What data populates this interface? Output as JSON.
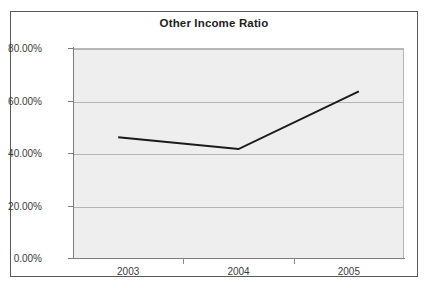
{
  "chart": {
    "title": "Other Income Ratio"
  },
  "chart_data": {
    "type": "line",
    "title": "Other Income Ratio",
    "xlabel": "",
    "ylabel": "",
    "categories": [
      "2003",
      "2004",
      "2005"
    ],
    "series": [
      {
        "name": "Other Income Ratio",
        "values": [
          0.46,
          0.415,
          0.635
        ],
        "color": "#1a1a1a"
      }
    ],
    "y_ticks": [
      0,
      0.2,
      0.4,
      0.6,
      0.8
    ],
    "y_tick_labels": [
      "0.00%",
      "20.00%",
      "40.00%",
      "60.00%",
      "80.00%"
    ],
    "ylim": [
      0,
      0.8
    ],
    "grid": true,
    "legend": false,
    "plot_background": "#eeeeee",
    "gridline_color": "#b4b4b4",
    "border_color": "#5a5a5a"
  }
}
